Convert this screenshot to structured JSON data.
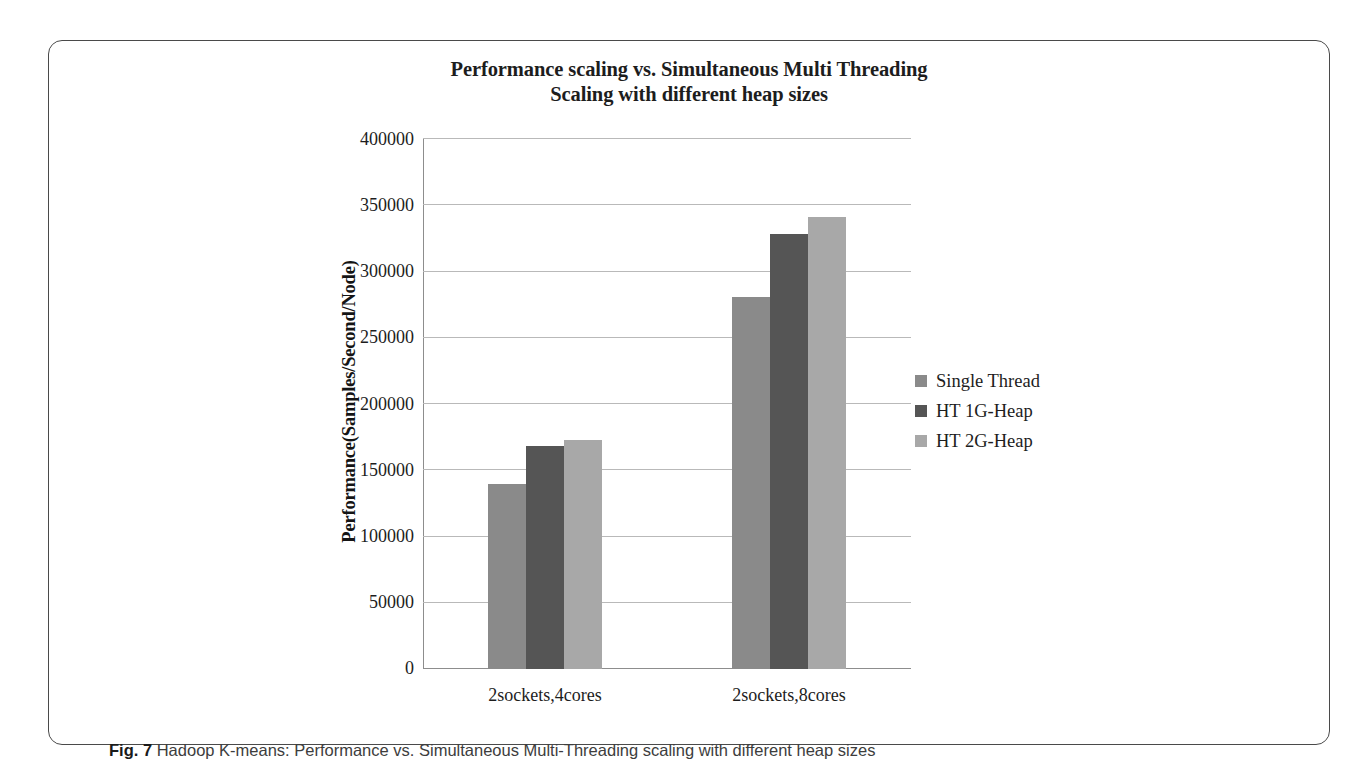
{
  "figure": {
    "caption_tag": "Fig. 7",
    "caption_text": "Hadoop K-means: Performance vs. Simultaneous Multi-Threading scaling with different heap sizes"
  },
  "chart_data": {
    "type": "bar",
    "title": "Performance scaling vs. Simultaneous Multi Threading Scaling with different heap sizes",
    "title_lines": [
      "Performance scaling vs. Simultaneous Multi Threading",
      "Scaling with different heap sizes"
    ],
    "xlabel": "",
    "ylabel": "Performance(Samples/Second/Node)",
    "categories": [
      "2sockets,4cores",
      "2sockets,8cores"
    ],
    "series": [
      {
        "name": "Single Thread",
        "color": "#8a8a8a",
        "values": [
          140000,
          281000
        ]
      },
      {
        "name": "HT 1G-Heap",
        "color": "#555555",
        "values": [
          168000,
          328000
        ]
      },
      {
        "name": "HT 2G-Heap",
        "color": "#a8a8a8",
        "values": [
          173000,
          341000
        ]
      }
    ],
    "ylim": [
      0,
      400000
    ],
    "ytick_step": 50000,
    "yticks": [
      0,
      50000,
      100000,
      150000,
      200000,
      250000,
      300000,
      350000,
      400000
    ],
    "ytick_labels": [
      "0",
      "50000",
      "100000",
      "150000",
      "200000",
      "250000",
      "300000",
      "350000",
      "400000"
    ],
    "grid": true,
    "legend_position": "right"
  }
}
